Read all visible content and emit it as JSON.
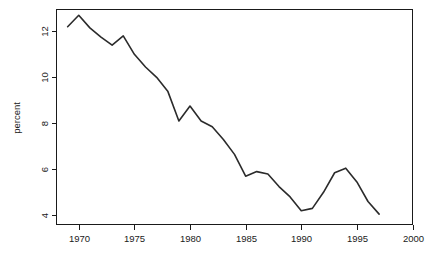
{
  "chart_data": {
    "type": "line",
    "title": "",
    "subtitle": "",
    "xlabel": "",
    "ylabel": "percent",
    "xlim": [
      1968.0,
      2000.0
    ],
    "ylim": [
      3.6,
      12.95
    ],
    "grid": false,
    "legend": null,
    "xticks": [
      1970,
      1975,
      1980,
      1985,
      1990,
      1995,
      2000
    ],
    "xtick_labels": [
      "1970",
      "1975",
      "1980",
      "1985",
      "1990",
      "1995",
      "2000"
    ],
    "yticks": [
      4,
      6,
      8,
      10,
      12
    ],
    "ytick_labels": [
      "4",
      "6",
      "8",
      "10",
      "12"
    ],
    "series": [
      {
        "name": "percent",
        "color": "#2b2b2b",
        "x": [
          1969,
          1970,
          1971,
          1972,
          1973,
          1974,
          1975,
          1976,
          1977,
          1978,
          1979,
          1980,
          1981,
          1982,
          1983,
          1984,
          1985,
          1986,
          1987,
          1988,
          1989,
          1990,
          1991,
          1992,
          1993,
          1994,
          1995,
          1996,
          1997
        ],
        "values": [
          12.2,
          12.7,
          12.15,
          11.75,
          11.4,
          11.8,
          11.0,
          10.45,
          10.0,
          9.4,
          8.1,
          8.75,
          8.1,
          7.85,
          7.3,
          6.65,
          5.7,
          5.9,
          5.8,
          5.25,
          4.8,
          4.2,
          4.3,
          5.0,
          5.85,
          6.05,
          5.45,
          4.6,
          4.05
        ]
      }
    ]
  },
  "axis": {
    "y_title": "percent"
  }
}
